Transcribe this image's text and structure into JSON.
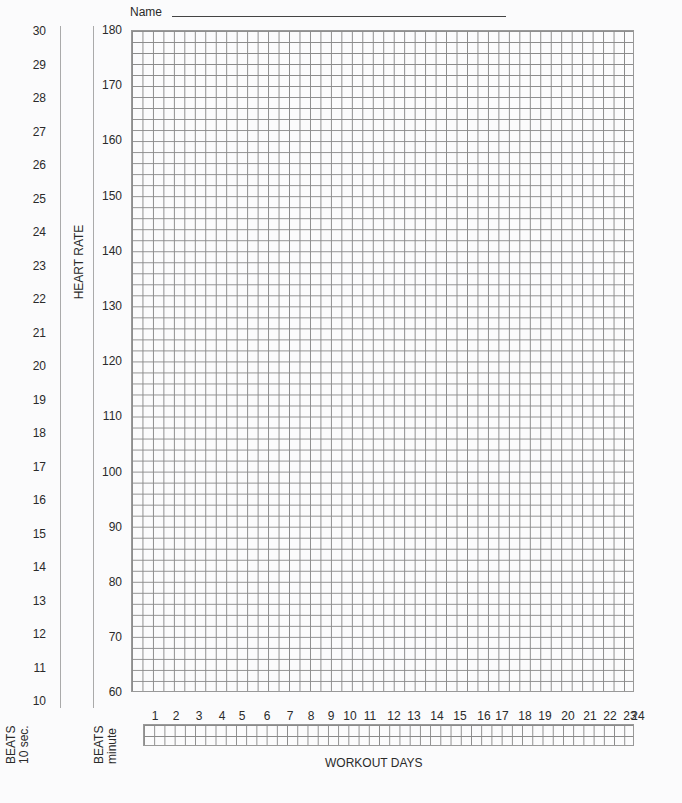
{
  "header": {
    "name_label": "Name"
  },
  "chart_data": {
    "type": "table",
    "ylabel": "HEART RATE",
    "xlabel": "WORKOUT DAYS",
    "y_axis_beats_per_minute": {
      "label_line1": "BEATS",
      "label_line2": "minute",
      "ticks": [
        180,
        170,
        160,
        150,
        140,
        130,
        120,
        110,
        100,
        90,
        80,
        70,
        60
      ],
      "ylim": [
        60,
        180
      ]
    },
    "y_axis_beats_per_10sec": {
      "label_line1": "BEATS",
      "label_line2": "10 sec.",
      "ticks": [
        30,
        29,
        28,
        27,
        26,
        25,
        24,
        23,
        22,
        21,
        20,
        19,
        18,
        17,
        16,
        15,
        14,
        13,
        12,
        11,
        10
      ],
      "ylim": [
        10,
        30
      ]
    },
    "x_ticks": [
      1,
      2,
      3,
      4,
      5,
      6,
      7,
      8,
      9,
      10,
      11,
      12,
      13,
      14,
      15,
      16,
      17,
      18,
      19,
      20,
      21,
      22,
      23,
      24
    ],
    "grid": true,
    "series": []
  }
}
